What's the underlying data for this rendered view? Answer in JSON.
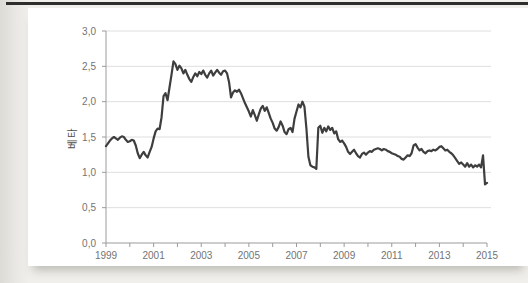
{
  "figure": {
    "ylabel": "베타"
  },
  "chart_data": {
    "type": "line",
    "title": "",
    "xlabel": "",
    "ylabel": "베타",
    "x_start_year": 1999,
    "x_interval": "monthly",
    "xlim": [
      1999,
      2015
    ],
    "ylim": [
      0.0,
      3.0
    ],
    "grid": "horizontal",
    "legend": "none",
    "colors": {
      "line": "#3e3e3e",
      "grid": "#dedede",
      "axis": "#9b9b9b",
      "tick_text": "#737373"
    },
    "yticks": [
      {
        "label": "0,0",
        "value": 0.0
      },
      {
        "label": "0,5",
        "value": 0.5
      },
      {
        "label": "1,0",
        "value": 1.0
      },
      {
        "label": "1,5",
        "value": 1.5
      },
      {
        "label": "2,0",
        "value": 2.0
      },
      {
        "label": "2,5",
        "value": 2.5
      },
      {
        "label": "3,0",
        "value": 3.0
      }
    ],
    "xticks_labeled": [
      {
        "label": "1999",
        "value": 1999
      },
      {
        "label": "2001",
        "value": 2001
      },
      {
        "label": "2003",
        "value": 2003
      },
      {
        "label": "2005",
        "value": 2005
      },
      {
        "label": "2007",
        "value": 2007
      },
      {
        "label": "2009",
        "value": 2009
      },
      {
        "label": "2011",
        "value": 2011
      },
      {
        "label": "2013",
        "value": 2013
      },
      {
        "label": "2015",
        "value": 2015
      }
    ],
    "xticks_minor_every": 1,
    "series": [
      {
        "name": "베타",
        "values": [
          1.37,
          1.41,
          1.45,
          1.48,
          1.5,
          1.48,
          1.46,
          1.49,
          1.51,
          1.5,
          1.46,
          1.43,
          1.44,
          1.46,
          1.45,
          1.38,
          1.27,
          1.2,
          1.25,
          1.29,
          1.24,
          1.21,
          1.29,
          1.36,
          1.48,
          1.58,
          1.62,
          1.61,
          1.78,
          2.08,
          2.12,
          2.02,
          2.2,
          2.38,
          2.57,
          2.53,
          2.45,
          2.51,
          2.47,
          2.4,
          2.45,
          2.38,
          2.32,
          2.28,
          2.35,
          2.4,
          2.36,
          2.42,
          2.39,
          2.44,
          2.38,
          2.34,
          2.4,
          2.44,
          2.37,
          2.41,
          2.45,
          2.41,
          2.38,
          2.43,
          2.44,
          2.4,
          2.28,
          2.06,
          2.13,
          2.16,
          2.14,
          2.17,
          2.12,
          2.05,
          1.98,
          1.92,
          1.86,
          1.79,
          1.88,
          1.81,
          1.73,
          1.82,
          1.9,
          1.94,
          1.87,
          1.92,
          1.84,
          1.76,
          1.7,
          1.62,
          1.59,
          1.64,
          1.72,
          1.66,
          1.57,
          1.54,
          1.61,
          1.63,
          1.57,
          1.76,
          1.86,
          1.96,
          1.92,
          2.0,
          1.93,
          1.62,
          1.22,
          1.1,
          1.08,
          1.07,
          1.05,
          1.63,
          1.66,
          1.56,
          1.63,
          1.58,
          1.65,
          1.6,
          1.63,
          1.55,
          1.58,
          1.47,
          1.43,
          1.45,
          1.41,
          1.36,
          1.29,
          1.26,
          1.29,
          1.32,
          1.27,
          1.23,
          1.21,
          1.26,
          1.28,
          1.25,
          1.28,
          1.3,
          1.29,
          1.32,
          1.33,
          1.34,
          1.33,
          1.31,
          1.33,
          1.32,
          1.3,
          1.29,
          1.27,
          1.26,
          1.25,
          1.23,
          1.22,
          1.19,
          1.18,
          1.21,
          1.24,
          1.23,
          1.27,
          1.38,
          1.4,
          1.35,
          1.31,
          1.33,
          1.29,
          1.27,
          1.3,
          1.31,
          1.3,
          1.32,
          1.31,
          1.33,
          1.36,
          1.37,
          1.34,
          1.31,
          1.32,
          1.29,
          1.27,
          1.24,
          1.2,
          1.16,
          1.12,
          1.14,
          1.11,
          1.08,
          1.13,
          1.08,
          1.11,
          1.07,
          1.1,
          1.08,
          1.11,
          1.07,
          1.24,
          0.83,
          0.85
        ]
      }
    ]
  }
}
